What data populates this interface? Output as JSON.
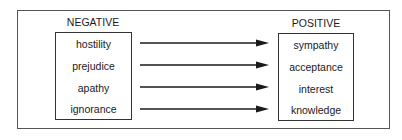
{
  "diagram": {
    "negative": {
      "heading": "NEGATIVE",
      "items": [
        "hostility",
        "prejudice",
        "apathy",
        "ignorance"
      ]
    },
    "positive": {
      "heading": "POSITIVE",
      "items": [
        "sympathy",
        "acceptance",
        "interest",
        "knowledge"
      ]
    },
    "arrows": [
      {
        "from": "hostility",
        "to": "sympathy"
      },
      {
        "from": "prejudice",
        "to": "acceptance"
      },
      {
        "from": "apathy",
        "to": "interest"
      },
      {
        "from": "ignorance",
        "to": "knowledge"
      }
    ],
    "colors": {
      "line": "#1a1a1a",
      "frame": "#555555",
      "background": "#ffffff"
    }
  }
}
